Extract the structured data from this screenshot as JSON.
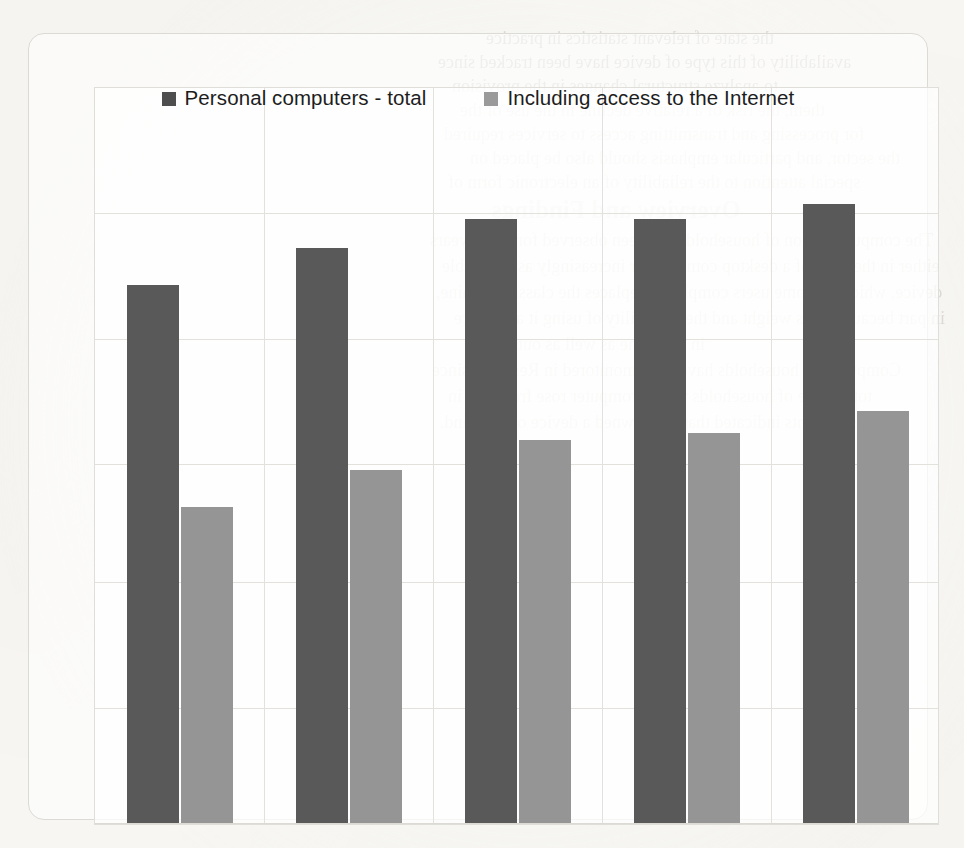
{
  "chart_data": {
    "type": "bar",
    "title": "",
    "subtitle": "",
    "xlabel": "",
    "ylabel": "",
    "grid": true,
    "legend_position": "top",
    "categories": [
      "1",
      "2",
      "3",
      "4",
      "5"
    ],
    "category_labels_visible": false,
    "axis_tick_labels_visible": false,
    "ylim": [
      0,
      100
    ],
    "gridline_values": [
      83,
      66,
      49,
      33,
      16
    ],
    "series": [
      {
        "name": "Personal computers - total",
        "color": "#595959",
        "values": [
          73,
          78,
          82,
          82,
          84
        ]
      },
      {
        "name": "Including access to the Internet",
        "color": "#959595",
        "values": [
          43,
          48,
          52,
          53,
          56
        ]
      }
    ]
  },
  "legend": {
    "items": [
      {
        "label": "Personal computers - total",
        "swatch_color": "#4e4e4e"
      },
      {
        "label": "Including access to the Internet",
        "swatch_color": "#9a9a9a"
      }
    ]
  },
  "bleed_through": {
    "lines": [
      "the state of relevant statistics in practice",
      "availability of this type of device have been tracked since",
      "to analyze structural changes in the provision",
      "them, the risk of a relative decline in the use of the",
      "for processing and transmitting access to services required",
      "the sector, and particular emphasis should also be placed on",
      "special attention to the reliability of an electronic form of",
      "Overview and Findings",
      "The computerization of households has been observed for many years",
      "either in the form of a desktop computer or increasingly as a portable",
      "device, which for some users completely replaces the classic machine,",
      "in part because of its weight and the possibility of using it anywhere",
      "in the home as well as outside it.",
      "Computers in households have been monitored in Research since",
      "total share of households with a computer rose from one in",
      "respondents indicated that they owned a device of this kind."
    ]
  }
}
